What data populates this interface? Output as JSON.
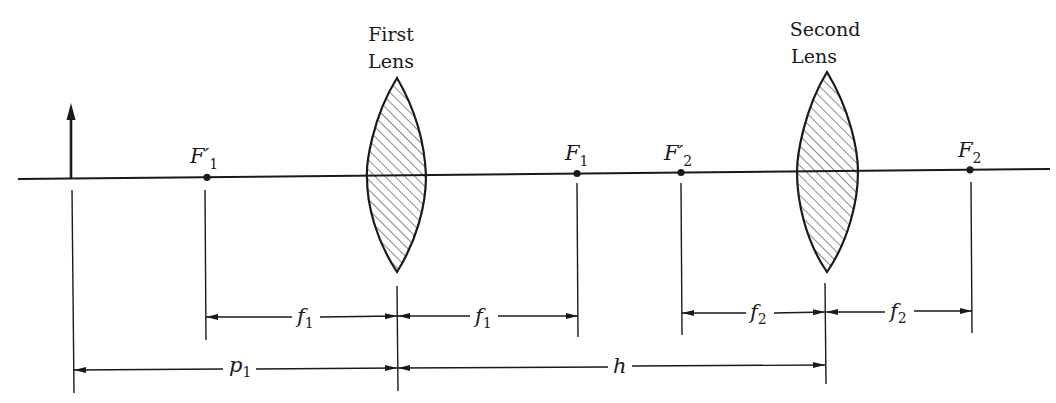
{
  "diagram": {
    "type": "two-lens optical system",
    "colors": {
      "ink": "#1a1a1a",
      "background": "#ffffff"
    },
    "lenses": [
      {
        "id": "first",
        "title_line1": "First",
        "title_line2": "Lens",
        "center_x": 397
      },
      {
        "id": "second",
        "title_line1": "Second",
        "title_line2": "Lens",
        "center_x": 827
      }
    ],
    "object": {
      "label": "object-arrow",
      "x": 71
    },
    "focal_points": [
      {
        "id": "F1_prime",
        "main": "F′",
        "sub": "1",
        "x": 207
      },
      {
        "id": "F1",
        "main": "F",
        "sub": "1",
        "x": 577
      },
      {
        "id": "F2_prime",
        "main": "F′",
        "sub": "2",
        "x": 681
      },
      {
        "id": "F2",
        "main": "F",
        "sub": "2",
        "x": 970
      }
    ],
    "dimensions": [
      {
        "id": "f1_left",
        "main": "f",
        "sub": "1",
        "from": "F′1",
        "to": "First Lens"
      },
      {
        "id": "f1_right",
        "main": "f",
        "sub": "1",
        "from": "First Lens",
        "to": "F1"
      },
      {
        "id": "f2_left",
        "main": "f",
        "sub": "2",
        "from": "F′2",
        "to": "Second Lens"
      },
      {
        "id": "f2_right",
        "main": "f",
        "sub": "2",
        "from": "Second Lens",
        "to": "F2"
      },
      {
        "id": "p1",
        "main": "p",
        "sub": "1",
        "from": "Object",
        "to": "First Lens"
      },
      {
        "id": "h",
        "main": "h",
        "sub": "",
        "from": "First Lens",
        "to": "Second Lens"
      }
    ]
  }
}
